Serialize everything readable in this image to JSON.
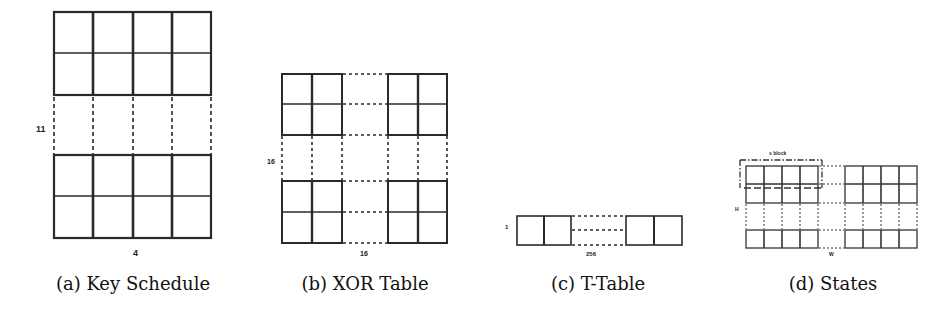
{
  "figures": [
    {
      "id": "a",
      "caption": "(a) Key Schedule",
      "row_label": "11",
      "col_label": "4",
      "rows": 11,
      "cols": 4,
      "shown_rows_top": 2,
      "shown_rows_bottom": 2
    },
    {
      "id": "b",
      "caption": "(b) XOR Table",
      "row_label": "16",
      "col_label": "16",
      "rows": 16,
      "cols": 16,
      "shown_cols_left": 2,
      "shown_cols_right": 2,
      "shown_rows_top": 2,
      "shown_rows_bottom": 2
    },
    {
      "id": "c",
      "caption": "(c) T-Table",
      "row_label": "1",
      "col_label": "256",
      "rows": 1,
      "cols": 256,
      "shown_cols_left": 2,
      "shown_cols_right": 2
    },
    {
      "id": "d",
      "caption": "(d) States",
      "row_label": "H",
      "col_label": "W",
      "block_label": "s block",
      "shown_cols_left": 4,
      "shown_cols_right": 4,
      "shown_rows_top": 2,
      "shown_rows_bottom": 1
    }
  ],
  "colors": {
    "line": "#2a2a2a",
    "background": "#ffffff"
  }
}
